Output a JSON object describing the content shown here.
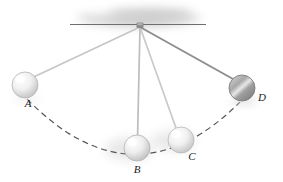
{
  "figure": {
    "background": "#ffffff"
  },
  "support": {
    "name": "ceiling-bar",
    "line_color": "#6e6e6e",
    "shadow_color": "#b9b9b9",
    "x1": 70,
    "x2": 206,
    "y": 24.5
  },
  "pivot": {
    "name": "pivot-block",
    "x": 140,
    "y": 26,
    "color": "#7a7a7a"
  },
  "strings": [
    {
      "label": "string-to-A",
      "to": "A",
      "color": "#c6c6c6",
      "width": 1.6
    },
    {
      "label": "string-to-B",
      "to": "B",
      "color": "#bdbdbd",
      "width": 1.6
    },
    {
      "label": "string-to-C",
      "to": "C",
      "color": "#c9c9c9",
      "width": 1.6
    },
    {
      "label": "string-to-D",
      "to": "D",
      "color": "#8e8e8e",
      "width": 2.0
    }
  ],
  "balls": [
    {
      "id": "A",
      "label": "A",
      "cx": 25,
      "cy": 85,
      "r": 13,
      "fill_light": "#fcfcfc",
      "fill_dark": "#c8c8c8",
      "edge": "#b5b5b5",
      "blur": false,
      "label_x": 28,
      "label_y": 106
    },
    {
      "id": "B",
      "label": "B",
      "cx": 137,
      "cy": 148,
      "r": 13,
      "fill_light": "#fbfbfb",
      "fill_dark": "#c5c5c5",
      "edge": "#b3b3b3",
      "blur": true,
      "label_x": 137,
      "label_y": 172
    },
    {
      "id": "C",
      "label": "C",
      "cx": 181,
      "cy": 140,
      "r": 13,
      "fill_light": "#fcfcfc",
      "fill_dark": "#cacaca",
      "edge": "#b8b8b8",
      "blur": true,
      "label_x": 192,
      "label_y": 159
    },
    {
      "id": "D",
      "label": "D",
      "cx": 242,
      "cy": 88,
      "r": 13,
      "fill_light": "#e2e2e2",
      "fill_dark": "#8f8f8f",
      "edge": "#7d7d7d",
      "blur": false,
      "label_x": 262,
      "label_y": 100
    }
  ],
  "arc": {
    "name": "swing-path",
    "style": "dashed",
    "color": "#555555",
    "width": 1.2,
    "dash": "6,4",
    "start_x": 27,
    "start_y": 99,
    "end_x": 240,
    "end_y": 102,
    "sag_x": 134,
    "sag_y": 172
  },
  "colors": {
    "line": "#6e6e6e",
    "dash": "#555555",
    "label": "#1a1a1a",
    "shadow": "#b9b9b9"
  }
}
